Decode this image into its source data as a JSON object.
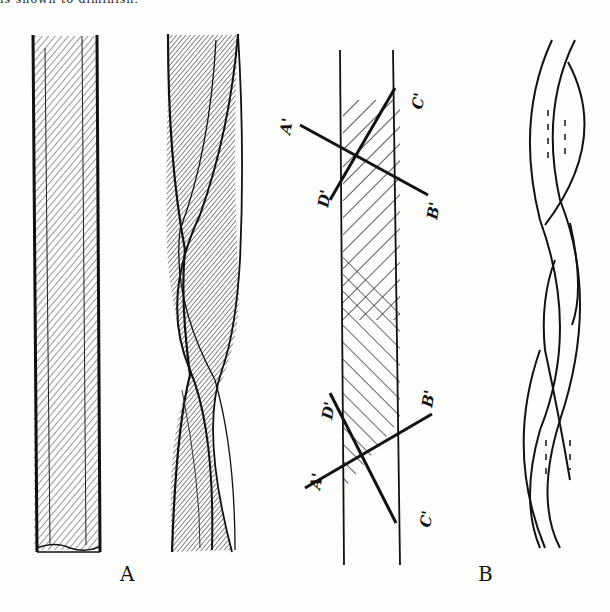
{
  "header": {
    "truncated_text": "is shown to diminish."
  },
  "figure": {
    "panels": [
      {
        "id": "A",
        "caption": "A",
        "parts": [
          "straight-fibre",
          "twisted-fibre"
        ]
      },
      {
        "id": "B",
        "caption": "B",
        "parts": [
          "ribbon-diagram",
          "twisted-ribbon-outline"
        ]
      }
    ],
    "labels": {
      "upper": {
        "A": "A'",
        "B": "B'",
        "C": "C'",
        "D": "D'"
      },
      "lower": {
        "A": "A'",
        "B": "B'",
        "C": "C'",
        "D": "D'"
      }
    },
    "colors": {
      "ink": "#111111",
      "paper": "#fdfdfb"
    }
  }
}
